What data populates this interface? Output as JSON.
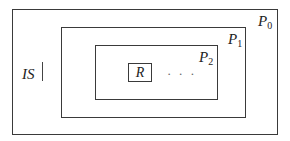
{
  "diagram": {
    "type": "nested-boxes",
    "outer": {
      "label": "P",
      "subscript": "0"
    },
    "middle": {
      "label": "P",
      "subscript": "1"
    },
    "inner": {
      "label": "P",
      "subscript": "2"
    },
    "core": {
      "label": "R"
    },
    "ellipsis": "· · ·",
    "side_label": "IS"
  }
}
